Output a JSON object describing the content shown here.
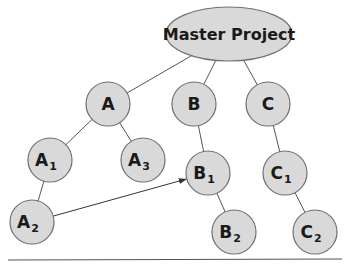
{
  "diagram": {
    "type": "tree",
    "colors": {
      "node_fill": "#d9d9d9",
      "node_stroke": "#707070",
      "edge": "#555555",
      "arrow": "#333333",
      "baseline": "#555555"
    },
    "root": {
      "id": "master",
      "label": "Master Project",
      "cx": 229,
      "cy": 34,
      "rx": 63,
      "ry": 27
    },
    "nodes": [
      {
        "id": "A",
        "base": "A",
        "sub": "",
        "cx": 108,
        "cy": 104
      },
      {
        "id": "B",
        "base": "B",
        "sub": "",
        "cx": 194,
        "cy": 104
      },
      {
        "id": "C",
        "base": "C",
        "sub": "",
        "cx": 268,
        "cy": 104
      },
      {
        "id": "A1",
        "base": "A",
        "sub": "1",
        "cx": 50,
        "cy": 160
      },
      {
        "id": "A3",
        "base": "A",
        "sub": "3",
        "cx": 143,
        "cy": 160
      },
      {
        "id": "B1",
        "base": "B",
        "sub": "1",
        "cx": 208,
        "cy": 173
      },
      {
        "id": "C1",
        "base": "C",
        "sub": "1",
        "cx": 285,
        "cy": 173
      },
      {
        "id": "A2",
        "base": "A",
        "sub": "2",
        "cx": 32,
        "cy": 222
      },
      {
        "id": "B2",
        "base": "B",
        "sub": "2",
        "cx": 234,
        "cy": 232
      },
      {
        "id": "C2",
        "base": "C",
        "sub": "2",
        "cx": 315,
        "cy": 232
      }
    ],
    "edges": [
      [
        "master",
        "A"
      ],
      [
        "master",
        "B"
      ],
      [
        "master",
        "C"
      ],
      [
        "A",
        "A1"
      ],
      [
        "A",
        "A3"
      ],
      [
        "A1",
        "A2"
      ],
      [
        "B",
        "B1"
      ],
      [
        "B1",
        "B2"
      ],
      [
        "C",
        "C1"
      ],
      [
        "C1",
        "C2"
      ]
    ],
    "arrows": [
      {
        "from": "A2",
        "to": "B1"
      }
    ],
    "node_radius": 22
  }
}
